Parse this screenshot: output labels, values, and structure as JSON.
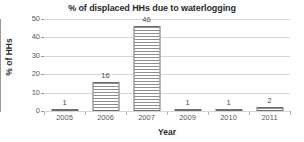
{
  "chart_data": {
    "type": "bar",
    "title": "% of displaced HHs due to waterlogging",
    "xlabel": "Year",
    "ylabel": "% of HHs",
    "categories": [
      "2005",
      "2006",
      "2007",
      "2009",
      "2010",
      "2011"
    ],
    "values": [
      1,
      16,
      46,
      1,
      1,
      2
    ],
    "data_labels": [
      "1",
      "16",
      "46",
      "1",
      "1",
      "2"
    ],
    "ylim": [
      0,
      50
    ],
    "y_ticks": [
      0,
      10,
      20,
      30,
      40,
      50
    ],
    "y_tick_labels": [
      "0",
      "10",
      "20",
      "30",
      "40",
      "50"
    ],
    "grid": true,
    "legend": false,
    "series": [
      {
        "name": "% of HHs",
        "values": [
          1,
          16,
          46,
          1,
          1,
          2
        ]
      }
    ],
    "colors": {
      "bar_fill": "#ffffff",
      "bar_hatch": "#8d8d8d",
      "bar_border": "#6e6e6e",
      "gridline": "#d6d6d6",
      "axis": "#9a9a9a",
      "text": "#3a3a3a",
      "title_text": "#2b2b2b",
      "background": "#ffffff"
    }
  }
}
